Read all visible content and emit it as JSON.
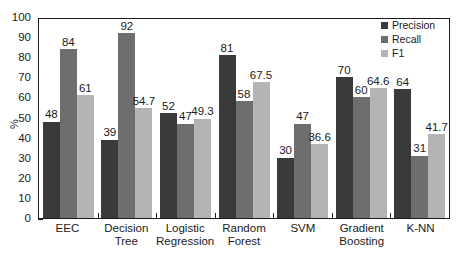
{
  "chart_data": {
    "type": "bar",
    "title": "",
    "xlabel": "",
    "ylabel": "%",
    "ylim": [
      0,
      100
    ],
    "ytick_step": 10,
    "yticks": [
      "100",
      "90",
      "80",
      "70",
      "60",
      "50",
      "40",
      "30",
      "20",
      "10",
      "0"
    ],
    "grid": false,
    "legend_position": "top-right",
    "categories": [
      "EEC",
      "Decision Tree",
      "Logistic Regression",
      "Random Forest",
      "SVM",
      "Gradient Boosting",
      "K-NN"
    ],
    "category_lines": [
      [
        "EEC",
        ""
      ],
      [
        "Decision",
        "Tree"
      ],
      [
        "Logistic",
        "Regression"
      ],
      [
        "Random",
        "Forest"
      ],
      [
        "SVM",
        ""
      ],
      [
        "Gradient",
        "Boosting"
      ],
      [
        "K-NN",
        ""
      ]
    ],
    "series": [
      {
        "name": "Precision",
        "color": "#3a3a3a",
        "values": [
          48,
          39,
          52,
          81,
          30,
          70,
          64
        ],
        "labels": [
          "48",
          "39",
          "52",
          "81",
          "30",
          "70",
          "64"
        ]
      },
      {
        "name": "Recall",
        "color": "#6e6e6e",
        "values": [
          84,
          92,
          47,
          58,
          47,
          60,
          31
        ],
        "labels": [
          "84",
          "92",
          "47",
          "58",
          "47",
          "60",
          "31"
        ]
      },
      {
        "name": "F1",
        "color": "#b4b4b4",
        "values": [
          61,
          54.7,
          49.3,
          67.5,
          36.6,
          64.6,
          41.7
        ],
        "labels": [
          "61",
          "54.7",
          "49.3",
          "67.5",
          "36.6",
          "64.6",
          "41.7"
        ]
      }
    ]
  }
}
